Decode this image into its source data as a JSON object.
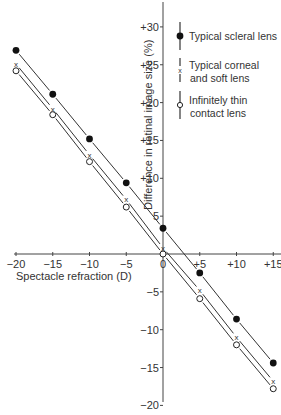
{
  "chart_data": {
    "type": "line",
    "title": "",
    "xlabel": "Spectacle refraction (D)",
    "ylabel": "Difference in retinal image size (%)",
    "x": [
      -20,
      -15,
      -10,
      -5,
      0,
      5,
      10,
      15
    ],
    "x_tick_labels": [
      "-20",
      "-15",
      "-10",
      "-5",
      "0",
      "+5",
      "+10",
      "+15"
    ],
    "y_ticks": [
      30,
      25,
      20,
      15,
      10,
      5,
      0,
      -5,
      -10,
      -15,
      -20
    ],
    "y_tick_labels": [
      "+30",
      "+25",
      "+20",
      "+15",
      "+10",
      "5",
      "",
      "-5",
      "-10",
      "-15",
      "-20"
    ],
    "xlim": [
      -20,
      15
    ],
    "ylim": [
      -20,
      32
    ],
    "grid": false,
    "legend_position": "upper right",
    "series": [
      {
        "name": "Typical scleral lens",
        "marker": "filled-circle",
        "values": [
          26.9,
          21.1,
          15.2,
          9.4,
          3.4,
          -2.5,
          -8.6,
          -14.4
        ]
      },
      {
        "name": "Typical corneal and soft lens",
        "marker": "x",
        "values": [
          25.1,
          19.2,
          13.1,
          7.2,
          0.8,
          -4.8,
          -11.0,
          -16.8
        ]
      },
      {
        "name": "Infinitely thin contact lens",
        "marker": "open-circle",
        "values": [
          24.2,
          18.4,
          12.2,
          6.2,
          0.0,
          -5.9,
          -12.0,
          -17.8
        ]
      }
    ],
    "legend": [
      {
        "line1": "Typical scleral lens",
        "line2": ""
      },
      {
        "line1": "Typical corneal",
        "line2": "and soft lens"
      },
      {
        "line1": "Infinitely thin",
        "line2": "contact lens"
      }
    ]
  }
}
